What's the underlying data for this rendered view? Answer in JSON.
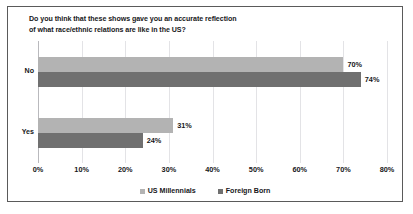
{
  "chart_data": {
    "type": "bar",
    "orientation": "horizontal",
    "title": "Do you think that these shows gave you an accurate reflection of what race/ethnic relations are like in the US?",
    "title_lines": [
      "Do you think that these shows gave you an accurate reflection",
      "of what race/ethnic relations are like in the US?"
    ],
    "categories": [
      "No",
      "Yes"
    ],
    "series": [
      {
        "name": "US Millennials",
        "color": "#b3b3b3",
        "values": [
          70,
          31
        ],
        "labels": [
          "70%",
          "31%"
        ]
      },
      {
        "name": "Foreign Born",
        "color": "#707070",
        "values": [
          74,
          24
        ],
        "labels": [
          "74%",
          "24%"
        ]
      }
    ],
    "xlabel": "",
    "ylabel": "",
    "xlim": [
      0,
      80
    ],
    "xticks": [
      0,
      10,
      20,
      30,
      40,
      50,
      60,
      70,
      80
    ],
    "xtick_labels": [
      "0%",
      "10%",
      "20%",
      "30%",
      "40%",
      "50%",
      "60%",
      "70%",
      "80%"
    ],
    "grid": true,
    "grid_axis": "x",
    "legend_position": "bottom",
    "value_suffix": "%"
  },
  "style": {
    "border_color": "#5a5a5a",
    "background": "#ffffff",
    "gridline_color": "#e3e3e6",
    "axis_color": "#b9b9bd",
    "text_color": "#17171a"
  }
}
